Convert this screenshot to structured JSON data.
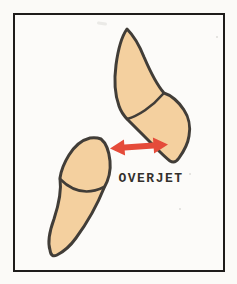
{
  "diagram": {
    "label": "OVERJET"
  },
  "colors": {
    "paper": "#fbfaf7",
    "paper_inner": "#fcfbf9",
    "border": "#1e1c1a",
    "outline": "#413d38",
    "tooth_fill": "#f4d09f",
    "arrow_red": "#e54b3a",
    "ink": "#33302c"
  }
}
